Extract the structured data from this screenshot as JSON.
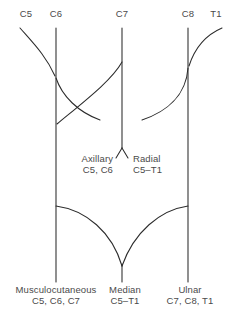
{
  "figure": {
    "type": "anatomical-diagram",
    "background_color": "#ffffff",
    "line_color": "#2b2b2b",
    "text_color": "#4a4a4a"
  },
  "roots": [
    {
      "id": "c5",
      "label": "C5",
      "x": 26,
      "y": 14
    },
    {
      "id": "c6",
      "label": "C6",
      "x": 56,
      "y": 14
    },
    {
      "id": "c7",
      "label": "C7",
      "x": 122,
      "y": 14
    },
    {
      "id": "c8",
      "label": "C8",
      "x": 188,
      "y": 14
    },
    {
      "id": "t1",
      "label": "T1",
      "x": 216,
      "y": 14
    }
  ],
  "mid_nerves": [
    {
      "id": "axillary",
      "name": "Axillary",
      "roots": "C5, C6",
      "x": 112,
      "y": 158,
      "align": "right"
    },
    {
      "id": "radial",
      "name": "Radial",
      "roots": "C5–T1",
      "x": 133,
      "y": 158,
      "align": "left"
    }
  ],
  "terminal_nerves": [
    {
      "id": "musculocutaneous",
      "name": "Musculocutaneous",
      "roots": "C5, C6, C7",
      "x": 56,
      "y": 288,
      "align": "center"
    },
    {
      "id": "median",
      "name": "Median",
      "roots": "C5–T1",
      "x": 125,
      "y": 288,
      "align": "center"
    },
    {
      "id": "ulnar",
      "name": "Ulnar",
      "roots": "C7, C8, T1",
      "x": 190,
      "y": 288,
      "align": "center"
    }
  ],
  "paths": {
    "c6_trunk": "M 56 28 L 56 282",
    "c7_trunk": "M 122 28 L 122 148",
    "c8_trunk": "M 188 28 L 188 282",
    "median_trunk": "M 122 264 L 122 282",
    "c5_to_c6": "M 20 28 C 34 44, 46 56, 55 76",
    "t1_to_c8": "M 222 28 C 208 34, 196 44, 189 66",
    "c6_to_c7_upper": "M 56 78 C 62 96, 78 112, 100 120",
    "c7_to_c6_lower": "M 122 62 C 112 80, 86 100, 57 124",
    "c8_to_c7": "M 188 68 C 186 96, 166 112, 142 120",
    "c7_axillary": "M 122 148 L 116 158",
    "c7_radial": "M 122 148 L 128 158",
    "c6_to_median": "M 56 206 C 86 210, 112 232, 122 266",
    "c8_to_median": "M 188 206 C 160 210, 134 232, 122 266"
  }
}
